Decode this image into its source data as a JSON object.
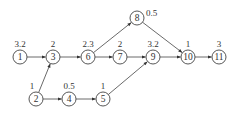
{
  "diagram": {
    "type": "activity-network",
    "nodes": [
      {
        "id": "1",
        "label": "1",
        "weight": "3.2",
        "x": 20,
        "y": 57
      },
      {
        "id": "3",
        "label": "3",
        "weight": "2",
        "x": 53,
        "y": 57
      },
      {
        "id": "6",
        "label": "6",
        "weight": "2.3",
        "x": 88,
        "y": 57
      },
      {
        "id": "7",
        "label": "7",
        "weight": "2",
        "x": 120,
        "y": 57
      },
      {
        "id": "9",
        "label": "9",
        "weight": "3.2",
        "x": 153,
        "y": 57
      },
      {
        "id": "10",
        "label": "10",
        "weight": "1",
        "x": 188,
        "y": 57
      },
      {
        "id": "11",
        "label": "11",
        "weight": "3",
        "x": 219,
        "y": 57
      },
      {
        "id": "8",
        "label": "8",
        "weight": "0.5",
        "x": 137,
        "y": 18
      },
      {
        "id": "2",
        "label": "2",
        "weight": "1",
        "x": 36,
        "y": 99
      },
      {
        "id": "4",
        "label": "4",
        "weight": "0.5",
        "x": 69,
        "y": 99
      },
      {
        "id": "5",
        "label": "5",
        "weight": "1",
        "x": 103,
        "y": 99
      }
    ],
    "edges": [
      {
        "from": "1",
        "to": "3"
      },
      {
        "from": "3",
        "to": "6"
      },
      {
        "from": "6",
        "to": "7"
      },
      {
        "from": "7",
        "to": "9"
      },
      {
        "from": "9",
        "to": "10"
      },
      {
        "from": "10",
        "to": "11"
      },
      {
        "from": "6",
        "to": "8"
      },
      {
        "from": "8",
        "to": "10"
      },
      {
        "from": "2",
        "to": "3"
      },
      {
        "from": "2",
        "to": "4"
      },
      {
        "from": "4",
        "to": "5"
      },
      {
        "from": "5",
        "to": "9"
      }
    ]
  }
}
